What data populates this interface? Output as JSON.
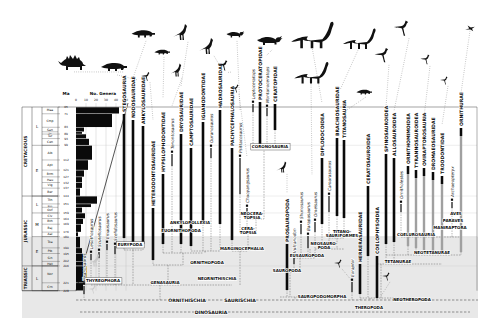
{
  "colors": {
    "bar": "#0a0a0a",
    "ghost_bar": "#a0a0a0",
    "band": "#d9d9d9",
    "grid": "#bdbdbd",
    "line": "#333333"
  },
  "timescale": {
    "ma_label": "Ma",
    "periods": [
      [
        "CRETACEOUS",
        [
          [
            "L",
            65,
            99
          ],
          [
            "E",
            99,
            144
          ]
        ]
      ],
      [
        "JURASSIC",
        [
          [
            "L",
            144,
            159
          ],
          [
            "M",
            159,
            180
          ],
          [
            "E",
            180,
            206
          ]
        ]
      ],
      [
        "TRIASSIC",
        [
          [
            "L",
            206,
            228
          ]
        ]
      ]
    ],
    "ma_ticks": [
      65,
      71,
      83,
      89,
      93,
      99,
      112,
      121,
      127,
      132,
      137,
      144,
      151,
      159,
      164,
      169,
      176,
      180,
      190,
      195,
      202,
      206,
      221,
      228
    ]
  },
  "histogram": {
    "title": "No. Genera",
    "ma_label": "Ma",
    "axis_ticks": [
      0,
      10,
      20,
      30,
      40,
      50
    ],
    "stages": [
      [
        "Maa",
        65,
        71,
        43
      ],
      [
        "Cmp",
        71,
        83,
        36
      ],
      [
        "San",
        83,
        87,
        8
      ],
      [
        "Con",
        87,
        89,
        6
      ],
      [
        "Tur",
        89,
        93,
        10
      ],
      [
        "Cen",
        93,
        99,
        13
      ],
      [
        "Alb",
        99,
        112,
        16
      ],
      [
        "Apt",
        112,
        121,
        12
      ],
      [
        "Brm",
        121,
        127,
        8
      ],
      [
        "Hau",
        127,
        132,
        6
      ],
      [
        "Vlg",
        132,
        137,
        6
      ],
      [
        "Ber",
        137,
        144,
        4
      ],
      [
        "Tth",
        144,
        151,
        21
      ],
      [
        "Kim",
        151,
        154,
        15
      ],
      [
        "Oxf",
        154,
        159,
        6
      ],
      [
        "Clv",
        159,
        164,
        9
      ],
      [
        "Bth",
        164,
        169,
        7
      ],
      [
        "Baj",
        169,
        176,
        5
      ],
      [
        "Aal",
        176,
        180,
        2
      ],
      [
        "Toa",
        180,
        190,
        4
      ],
      [
        "Plb",
        190,
        195,
        6
      ],
      [
        "Sin",
        195,
        202,
        9
      ],
      [
        "Het",
        202,
        206,
        7
      ],
      [
        "Nor",
        206,
        221,
        11
      ],
      [
        "Crn",
        221,
        228,
        7
      ]
    ]
  },
  "chart_data": {
    "type": "bar",
    "title": "No. Genera",
    "categories": [
      "Maa",
      "Cmp",
      "San",
      "Con",
      "Tur",
      "Cen",
      "Alb",
      "Apt",
      "Brm",
      "Hau",
      "Vlg",
      "Ber",
      "Tth",
      "Kim",
      "Oxf",
      "Clv",
      "Bth",
      "Baj",
      "Aal",
      "Toa",
      "Plb",
      "Sin",
      "Het",
      "Nor",
      "Crn"
    ],
    "values": [
      43,
      36,
      8,
      6,
      10,
      13,
      16,
      12,
      8,
      6,
      6,
      4,
      21,
      15,
      6,
      9,
      7,
      5,
      2,
      4,
      6,
      9,
      7,
      11,
      7
    ],
    "xlabel": "No. Genera",
    "ylabel": "Ma",
    "xlim": [
      0,
      50
    ],
    "grid": true
  },
  "tree": {
    "taxa": [
      [
        "Pisanosaurus",
        84,
        236,
        286,
        294,
        "genus",
        300
      ],
      [
        "Lesothosaurus",
        91,
        202,
        254,
        260,
        "genus",
        285
      ],
      [
        "Scutellosaurus",
        99,
        204,
        252,
        258,
        "genus",
        285
      ],
      [
        "Emausaurus",
        107,
        200,
        244,
        250,
        "genus",
        285
      ],
      [
        "Scelidosaurus",
        115,
        202,
        246,
        254,
        "genus",
        285
      ],
      [
        "STEGOSAURIA",
        124,
        70,
        114,
        238,
        "clade",
        250
      ],
      [
        "NODOSAURIDAE",
        133,
        76,
        120,
        242,
        "clade",
        250
      ],
      [
        "ANKYLOSAURIDAE",
        143,
        80,
        126,
        244,
        "clade",
        250
      ],
      [
        "HETERODONTOSAURIDAE",
        153,
        118,
        208,
        260,
        "clade",
        265
      ],
      [
        "HYPSILOPHODONTIDAE",
        163,
        96,
        174,
        244,
        "clade",
        253
      ],
      [
        "Tenontosaurus",
        172,
        104,
        154,
        166,
        "genus",
        253
      ],
      [
        "DRYOSAURIDAE",
        181,
        84,
        134,
        244,
        "clade",
        253
      ],
      [
        "CAMPTOSAURIDAE",
        191,
        92,
        148,
        246,
        "clade",
        251
      ],
      [
        "IGUANODONTIDAE",
        203,
        74,
        122,
        222,
        "clade",
        251
      ],
      [
        "Ouranosaurus",
        211,
        98,
        148,
        158,
        "genus",
        251
      ],
      [
        "HADROSAURIDAE",
        220,
        64,
        110,
        224,
        "clade",
        251
      ],
      [
        "PACHYCEPHALOSAURIA",
        232,
        68,
        148,
        240,
        "clade",
        251
      ],
      [
        "Psittacosaurus",
        240,
        108,
        158,
        194,
        "genus",
        233
      ],
      [
        "Chaoyangsaurus",
        247,
        156,
        208,
        218,
        "genus",
        233
      ],
      [
        "Leptoceratops",
        253,
        58,
        104,
        112,
        "genus",
        148
      ],
      [
        "PROTOCERATOPIDAE",
        260,
        54,
        102,
        144,
        "clade",
        148
      ],
      [
        "Montanoceratops",
        267,
        62,
        108,
        116,
        "genus",
        148
      ],
      [
        "CERATOPIDAE",
        275,
        64,
        104,
        130,
        "clade",
        148
      ],
      [
        "PROSAUROPODA",
        287,
        192,
        244,
        290,
        "clade",
        297
      ],
      [
        "Vulcanodon",
        294,
        210,
        258,
        264,
        "genus",
        272
      ],
      [
        "Shunosaurus",
        301,
        176,
        224,
        234,
        "genus",
        258
      ],
      [
        "Barapasaurus",
        308,
        188,
        236,
        248,
        "genus",
        258
      ],
      [
        "Omeisaurus",
        315,
        174,
        222,
        232,
        "genus",
        258
      ],
      [
        "DIPLODOCOIDEA",
        322,
        102,
        158,
        224,
        "clade",
        249
      ],
      [
        "Camarasaurus",
        329,
        146,
        196,
        212,
        "genus",
        249
      ],
      [
        "BRACHIOSAURIDAE",
        337,
        88,
        138,
        216,
        "clade",
        238
      ],
      [
        "TITANOSAURIA",
        344,
        90,
        140,
        218,
        "clade",
        238
      ],
      [
        "Eoraptor",
        352,
        226,
        282,
        292,
        "genus",
        300
      ],
      [
        "HERRERASAURIDAE",
        360,
        198,
        264,
        294,
        "clade",
        300
      ],
      [
        "CERATOSAUROIDEA",
        368,
        103,
        186,
        256,
        "clade",
        298
      ],
      [
        "COELOPHYSOIDEA",
        377,
        194,
        256,
        298,
        "clade",
        300
      ],
      [
        "SPINOSAUROIDEA",
        386,
        106,
        154,
        244,
        "clade",
        264
      ],
      [
        "ALLOSAUROIDEA",
        394,
        110,
        158,
        242,
        "clade",
        264
      ],
      [
        "Ornitholestes",
        401,
        158,
        204,
        212,
        "genus",
        237
      ],
      [
        "ORNITHOMIMOIDEA",
        408,
        110,
        166,
        246,
        "ghost",
        255
      ],
      [
        "TYRANNOSAUROIDEA",
        416,
        114,
        170,
        248,
        "ghost",
        255
      ],
      [
        "OVIRAPTOROSAURIA",
        424,
        116,
        168,
        250,
        "ghost",
        237
      ],
      [
        "DROMAEOSAURIDAE",
        433,
        118,
        172,
        252,
        "ghost",
        237
      ],
      [
        "TROODONTIDAE",
        442,
        124,
        176,
        254,
        "ghost",
        237
      ],
      [
        "Archaeopteryx",
        452,
        146,
        202,
        208,
        "genus",
        237
      ],
      [
        "ORNITHURAE",
        461,
        92,
        128,
        252,
        "ghost",
        255
      ]
    ],
    "clade_labels": [
      [
        "CORONOSAURIA",
        270,
        147,
        1
      ],
      [
        "NEOCERA-\nTOPSIA",
        252,
        214,
        0
      ],
      [
        "CERA-\nTOPSIA",
        248,
        229,
        0
      ],
      [
        "MARGINOCEPHALIA",
        242,
        249,
        0
      ],
      [
        "ANKYLOPOLLEXIA",
        190,
        223,
        0
      ],
      [
        "EUORNITHOPODA",
        181,
        231,
        0
      ],
      [
        "EURYPODA",
        130,
        245,
        1
      ],
      [
        "ORNITHOPODA",
        207,
        263,
        0
      ],
      [
        "NEORNITHISCHIA",
        217,
        279,
        0
      ],
      [
        "GENASAURIA",
        165,
        283,
        0
      ],
      [
        "THYREOPHORA",
        103,
        281,
        1
      ],
      [
        "SAUROPODA",
        287,
        271,
        0
      ],
      [
        "EUSAUROPODA",
        307,
        256,
        0
      ],
      [
        "NEOSAURO-\nPODA",
        324,
        244,
        0
      ],
      [
        "TITANO-\nSAURIFORMES",
        342,
        232,
        0
      ],
      [
        "SAUROPODOMORPHA",
        322,
        297,
        0
      ],
      [
        "THEROPODA",
        369,
        308,
        0
      ],
      [
        "NEOTHEROPODA",
        412,
        300,
        0
      ],
      [
        "TETANURAE",
        398,
        262,
        0
      ],
      [
        "NEOTETANURAE",
        432,
        253,
        0
      ],
      [
        "COELUROSAURIA",
        416,
        235,
        0
      ],
      [
        "AVES",
        456,
        214,
        0
      ],
      [
        "PARAVES",
        453,
        221,
        0
      ],
      [
        "MANIRAPTORA",
        450,
        228,
        0
      ]
    ],
    "node_lines": [
      [
        124,
        250,
        143,
        250
      ],
      [
        133,
        250,
        133,
        285
      ],
      [
        91,
        285,
        232,
        285
      ],
      [
        163,
        253,
        203,
        253
      ],
      [
        183,
        253,
        183,
        265
      ],
      [
        153,
        265,
        183,
        265
      ],
      [
        168,
        265,
        168,
        285
      ],
      [
        191,
        251,
        220,
        251
      ],
      [
        205,
        251,
        205,
        253
      ],
      [
        253,
        148,
        275,
        148
      ],
      [
        264,
        148,
        264,
        219
      ],
      [
        247,
        219,
        264,
        219
      ],
      [
        256,
        219,
        256,
        233
      ],
      [
        240,
        233,
        256,
        233
      ],
      [
        248,
        233,
        248,
        251
      ],
      [
        232,
        251,
        248,
        251
      ],
      [
        240,
        251,
        240,
        285
      ],
      [
        160,
        285,
        160,
        300
      ],
      [
        285,
        272,
        296,
        272
      ],
      [
        290,
        272,
        290,
        297
      ],
      [
        294,
        258,
        315,
        258
      ],
      [
        300,
        258,
        300,
        272
      ],
      [
        315,
        249,
        344,
        249
      ],
      [
        310,
        249,
        310,
        258
      ],
      [
        329,
        238,
        344,
        238
      ],
      [
        337,
        238,
        337,
        249
      ],
      [
        280,
        297,
        310,
        297
      ],
      [
        295,
        297,
        295,
        300
      ],
      [
        401,
        237,
        461,
        237
      ],
      [
        386,
        255,
        461,
        255
      ],
      [
        377,
        264,
        442,
        264
      ],
      [
        381,
        264,
        381,
        298
      ],
      [
        360,
        298,
        412,
        298
      ],
      [
        370,
        298,
        370,
        300
      ]
    ],
    "baselines": [
      {
        "y": 300,
        "x1": 76,
        "x2": 478,
        "labels": [
          [
            "ORNITHISCHIA",
            187
          ],
          [
            "SAURISCHIA",
            240
          ]
        ]
      },
      {
        "y": 312,
        "x1": 80,
        "x2": 470,
        "labels": [
          [
            "DINOSAURIA",
            211
          ]
        ]
      }
    ],
    "silhouettes": [
      [
        "stegosaur",
        74,
        62,
        1.0,
        124,
        72,
        0
      ],
      [
        "ankylosaur",
        117,
        65,
        1.0,
        138,
        80,
        0
      ],
      [
        "ankylosaur",
        146,
        32,
        0.9,
        133,
        78,
        0
      ],
      [
        "theropod",
        150,
        77,
        0.55,
        153,
        120,
        0
      ],
      [
        "ankylosaur",
        164,
        51,
        0.6,
        163,
        98,
        0
      ],
      [
        "ornithopod",
        188,
        32,
        1.0,
        181,
        86,
        0
      ],
      [
        "ornithopod",
        182,
        70,
        0.8,
        172,
        106,
        0
      ],
      [
        "ornithopod",
        214,
        46,
        1.0,
        220,
        66,
        0
      ],
      [
        "ceratopsid",
        237,
        34,
        0.7,
        240,
        110,
        0
      ],
      [
        "theropod",
        228,
        66,
        0.65,
        232,
        72,
        0
      ],
      [
        "theropod",
        239,
        89,
        0.5,
        247,
        157,
        0
      ],
      [
        "ceratopsid",
        272,
        40,
        1.0,
        266,
        56,
        0
      ],
      [
        "sauropod",
        312,
        34,
        1.3,
        322,
        103,
        0
      ],
      [
        "sauropod",
        311,
        72,
        1.05,
        312,
        175,
        0
      ],
      [
        "sauropod",
        359,
        38,
        1.0,
        340,
        90,
        0
      ],
      [
        "ankylosaur",
        366,
        91,
        0.6,
        344,
        112,
        0
      ],
      [
        "theropod",
        389,
        56,
        0.9,
        386,
        107,
        0
      ],
      [
        "theropod",
        409,
        29,
        0.95,
        394,
        111,
        0
      ],
      [
        "theropod",
        430,
        60,
        0.6,
        424,
        117,
        0
      ],
      [
        "theropod",
        448,
        81,
        0.5,
        442,
        125,
        0
      ],
      [
        "bird",
        470,
        28,
        0.8,
        461,
        93,
        0
      ],
      [
        "ornithopod",
        287,
        167,
        0.7,
        287,
        193,
        0
      ],
      [
        "theropod",
        342,
        264,
        0.5,
        352,
        281,
        0
      ],
      [
        "theropod",
        390,
        277,
        0.5,
        381,
        296,
        0
      ],
      [
        "ornithopod",
        100,
        260,
        0.8,
        0,
        0,
        1
      ],
      [
        "theropod",
        96,
        290,
        0.5,
        0,
        0,
        1
      ]
    ]
  }
}
